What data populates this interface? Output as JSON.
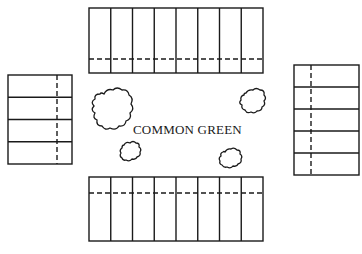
{
  "common_area": {
    "label": "COMMON GREEN"
  },
  "colors": {
    "line": "#1a1a1a",
    "background": "#ffffff"
  },
  "lot_blocks": [
    {
      "name": "top",
      "orientation": "horizontal-row",
      "lots": 8,
      "setback_line": "dashed-near-bottom"
    },
    {
      "name": "bottom",
      "orientation": "horizontal-row",
      "lots": 8,
      "setback_line": "dashed-near-top"
    },
    {
      "name": "left",
      "orientation": "vertical-column",
      "lots": 4,
      "setback_line": "dashed-near-right"
    },
    {
      "name": "right",
      "orientation": "vertical-column",
      "lots": 5,
      "setback_line": "dashed-near-left"
    }
  ],
  "trees": [
    {
      "name": "large-tree-upper-left",
      "size": "large"
    },
    {
      "name": "tree-upper-right",
      "size": "medium"
    },
    {
      "name": "tree-lower-left",
      "size": "small"
    },
    {
      "name": "tree-lower-right",
      "size": "small"
    }
  ]
}
